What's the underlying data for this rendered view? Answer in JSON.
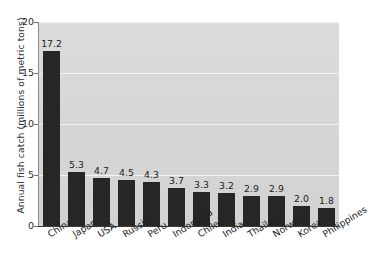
{
  "chart_data": {
    "type": "bar",
    "title": "",
    "xlabel": "",
    "ylabel": "Annual fish catch (millions of metric tons)",
    "ylim": [
      0,
      20
    ],
    "yticks": [
      0,
      5,
      10,
      15,
      20
    ],
    "ytick_labels": [
      "0",
      "5",
      "10",
      "15",
      "20"
    ],
    "grid": true,
    "legend": "none",
    "bar_color": "#262626",
    "plot_background": "#d6d6d6",
    "gridline_color": "#f4f4f4",
    "categories": [
      "China",
      "Japan",
      "USA",
      "Russia",
      "Peru",
      "Indonesia",
      "Chile",
      "India",
      "Thailand",
      "Norway",
      "Korea",
      "Philippines"
    ],
    "values": [
      17.2,
      5.3,
      4.7,
      4.5,
      4.3,
      3.7,
      3.3,
      3.2,
      2.9,
      2.9,
      2.0,
      1.8
    ],
    "value_labels": [
      "17.2",
      "5.3",
      "4.7",
      "4.5",
      "4.3",
      "3.7",
      "3.3",
      "3.2",
      "2.9",
      "2.9",
      "2.0",
      "1.8"
    ]
  }
}
